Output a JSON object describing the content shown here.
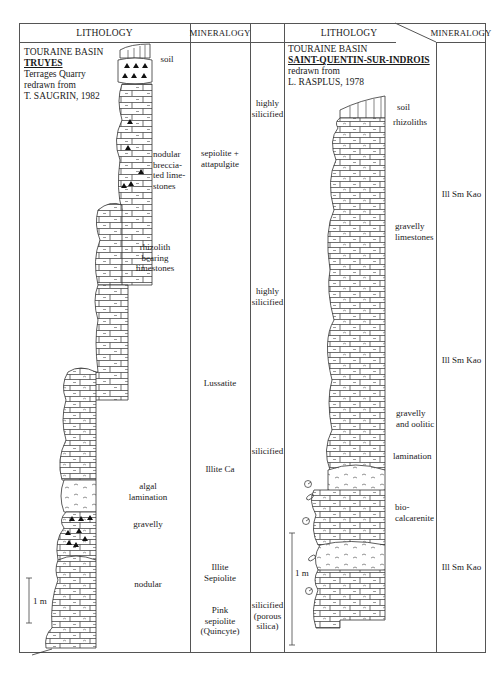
{
  "headers": {
    "lithology_left": "LITHOLOGY",
    "mineralogy_left": "MINERALOGY",
    "lithology_right": "LITHOLOGY",
    "mineralogy_right": "MINERALOGY"
  },
  "left_section": {
    "basin": "TOURAINE BASIN",
    "site": "TRUYES",
    "line3": "Terrages Quarry",
    "line4": "redrawn from",
    "source": "T. SAUGRIN, 1982",
    "units": [
      {
        "lines": [
          "soil"
        ]
      },
      {
        "lines": [
          "nodular",
          "breccia-",
          "ted lime-",
          "stones"
        ]
      },
      {
        "lines": [
          "rhizolith",
          "bearing",
          "limestones"
        ]
      },
      {
        "lines": [
          "algal",
          "lamination"
        ]
      },
      {
        "lines": [
          "gravelly"
        ]
      },
      {
        "lines": [
          "nodular"
        ]
      }
    ],
    "scale_label": "1 m",
    "mineralogy": [
      {
        "lines": [
          "sepiolite +",
          "attapulgite"
        ]
      },
      {
        "lines": [
          "Lussatite"
        ]
      },
      {
        "lines": [
          "Illite Ca"
        ]
      },
      {
        "lines": [
          "Illite",
          "Sepiolite"
        ]
      },
      {
        "lines": [
          "Pink",
          "sepiolite",
          "(Quincyte)"
        ]
      }
    ]
  },
  "middle_column": {
    "labels": [
      {
        "lines": [
          "highly",
          "silicified"
        ]
      },
      {
        "lines": [
          "highly",
          "silicified"
        ]
      },
      {
        "lines": [
          "silicified"
        ]
      },
      {
        "lines": [
          "silicified",
          "(porous",
          "silica)"
        ]
      }
    ]
  },
  "right_section": {
    "basin": "TOURAINE BASIN",
    "site": "SAINT-QUENTIN-SUR-INDROIS",
    "line3": "redrawn from",
    "source": "L. RASPLUS, 1978",
    "units": [
      {
        "lines": [
          "soil"
        ]
      },
      {
        "lines": [
          "rhizoliths"
        ]
      },
      {
        "lines": [
          "gravelly",
          "limestones"
        ]
      },
      {
        "lines": [
          "gravelly",
          "and oolitic"
        ]
      },
      {
        "lines": [
          "lamination"
        ]
      },
      {
        "lines": [
          "bio-",
          "calcarenite"
        ]
      }
    ],
    "scale_label": "1 m",
    "mineralogy": [
      {
        "lines": [
          "Ill Sm Kao"
        ]
      },
      {
        "lines": [
          "Ill Sm Kao"
        ]
      },
      {
        "lines": [
          "Ill Sm Kao"
        ]
      }
    ]
  },
  "colors": {
    "ink": "#1a1a1a",
    "rule": "#555555",
    "paper": "#ffffff"
  }
}
